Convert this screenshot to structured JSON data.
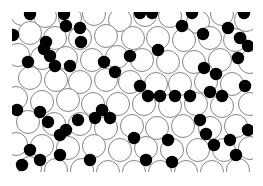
{
  "figure": {
    "colors": {
      "background": "#ffffff",
      "large_fill": "#ffffff",
      "large_stroke": "#777777",
      "small_fill": "#000000"
    },
    "clip": {
      "x": 12,
      "y": 12,
      "w": 241,
      "h": 160
    },
    "large_radius": 11.5,
    "small_radius": 6.2,
    "large": [
      [
        22,
        14
      ],
      [
        45,
        16
      ],
      [
        70,
        18
      ],
      [
        94,
        14
      ],
      [
        120,
        20
      ],
      [
        145,
        15
      ],
      [
        170,
        16
      ],
      [
        198,
        22
      ],
      [
        222,
        14
      ],
      [
        246,
        20
      ],
      [
        30,
        33
      ],
      [
        55,
        38
      ],
      [
        80,
        38
      ],
      [
        106,
        36
      ],
      [
        133,
        38
      ],
      [
        158,
        38
      ],
      [
        184,
        40
      ],
      [
        210,
        38
      ],
      [
        235,
        40
      ],
      [
        18,
        55
      ],
      [
        42,
        58
      ],
      [
        66,
        58
      ],
      [
        92,
        60
      ],
      [
        117,
        57
      ],
      [
        142,
        60
      ],
      [
        168,
        62
      ],
      [
        194,
        62
      ],
      [
        220,
        60
      ],
      [
        250,
        62
      ],
      [
        30,
        78
      ],
      [
        56,
        80
      ],
      [
        80,
        82
      ],
      [
        106,
        80
      ],
      [
        130,
        82
      ],
      [
        156,
        84
      ],
      [
        180,
        84
      ],
      [
        206,
        82
      ],
      [
        232,
        84
      ],
      [
        16,
        98
      ],
      [
        42,
        102
      ],
      [
        68,
        100
      ],
      [
        93,
        104
      ],
      [
        118,
        104
      ],
      [
        144,
        104
      ],
      [
        170,
        106
      ],
      [
        196,
        104
      ],
      [
        222,
        106
      ],
      [
        250,
        104
      ],
      [
        28,
        122
      ],
      [
        54,
        124
      ],
      [
        80,
        124
      ],
      [
        106,
        128
      ],
      [
        132,
        126
      ],
      [
        157,
        128
      ],
      [
        183,
        126
      ],
      [
        210,
        128
      ],
      [
        236,
        126
      ],
      [
        16,
        144
      ],
      [
        42,
        146
      ],
      [
        68,
        148
      ],
      [
        94,
        146
      ],
      [
        120,
        150
      ],
      [
        146,
        148
      ],
      [
        172,
        150
      ],
      [
        198,
        150
      ],
      [
        224,
        150
      ],
      [
        250,
        148
      ],
      [
        30,
        168
      ],
      [
        56,
        170
      ],
      [
        82,
        170
      ],
      [
        108,
        172
      ],
      [
        134,
        172
      ],
      [
        160,
        172
      ],
      [
        186,
        172
      ],
      [
        212,
        172
      ],
      [
        238,
        170
      ]
    ],
    "small": [
      [
        30,
        14
      ],
      [
        64,
        14
      ],
      [
        66,
        26
      ],
      [
        140,
        13
      ],
      [
        152,
        13
      ],
      [
        192,
        13
      ],
      [
        244,
        13
      ],
      [
        13,
        35
      ],
      [
        46,
        42
      ],
      [
        44,
        49
      ],
      [
        50,
        56
      ],
      [
        80,
        28
      ],
      [
        81,
        42
      ],
      [
        130,
        56
      ],
      [
        158,
        50
      ],
      [
        182,
        26
      ],
      [
        203,
        34
      ],
      [
        228,
        28
      ],
      [
        240,
        38
      ],
      [
        70,
        66
      ],
      [
        104,
        62
      ],
      [
        115,
        72
      ],
      [
        204,
        68
      ],
      [
        216,
        74
      ],
      [
        238,
        58
      ],
      [
        248,
        46
      ],
      [
        28,
        62
      ],
      [
        55,
        66
      ],
      [
        17,
        110
      ],
      [
        40,
        112
      ],
      [
        48,
        122
      ],
      [
        60,
        135
      ],
      [
        66,
        130
      ],
      [
        78,
        120
      ],
      [
        95,
        118
      ],
      [
        102,
        110
      ],
      [
        110,
        118
      ],
      [
        140,
        86
      ],
      [
        148,
        96
      ],
      [
        160,
        96
      ],
      [
        175,
        96
      ],
      [
        190,
        96
      ],
      [
        210,
        92
      ],
      [
        222,
        96
      ],
      [
        245,
        86
      ],
      [
        30,
        150
      ],
      [
        40,
        160
      ],
      [
        22,
        165
      ],
      [
        60,
        155
      ],
      [
        90,
        160
      ],
      [
        134,
        138
      ],
      [
        146,
        160
      ],
      [
        168,
        140
      ],
      [
        172,
        162
      ],
      [
        200,
        120
      ],
      [
        206,
        134
      ],
      [
        214,
        145
      ],
      [
        230,
        140
      ],
      [
        236,
        155
      ],
      [
        248,
        130
      ]
    ]
  }
}
